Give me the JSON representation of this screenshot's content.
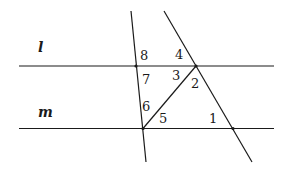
{
  "diagram": {
    "type": "parallel-lines-transversals",
    "stroke_color": "#1a1a1a",
    "lines": [
      {
        "name": "l",
        "label": "l",
        "x1": 19,
        "y1": 66,
        "x2": 274,
        "y2": 66,
        "label_x": 38,
        "label_y": 52
      },
      {
        "name": "m",
        "label": "m",
        "x1": 19,
        "y1": 128.5,
        "x2": 274,
        "y2": 128.5,
        "label_x": 38,
        "label_y": 117
      },
      {
        "name": "left-transversal",
        "x1": 131,
        "y1": 11,
        "x2": 146,
        "y2": 162
      },
      {
        "name": "right-transversal",
        "x1": 164,
        "y1": 11,
        "x2": 252,
        "y2": 162
      },
      {
        "name": "diagonal",
        "x1": 196,
        "y1": 66,
        "x2": 143,
        "y2": 128.5
      }
    ],
    "points": [
      {
        "x": 136,
        "y": 66
      },
      {
        "x": 196,
        "y": 66
      },
      {
        "x": 143,
        "y": 128.5
      },
      {
        "x": 233,
        "y": 128.5
      }
    ],
    "angles": [
      {
        "label": "1",
        "x": 209,
        "y": 123
      },
      {
        "label": "2",
        "x": 191,
        "y": 88
      },
      {
        "label": "3",
        "x": 172,
        "y": 80
      },
      {
        "label": "4",
        "x": 175,
        "y": 59
      },
      {
        "label": "5",
        "x": 159,
        "y": 123
      },
      {
        "label": "6",
        "x": 142,
        "y": 111
      },
      {
        "label": "7",
        "x": 142,
        "y": 84
      },
      {
        "label": "8",
        "x": 140,
        "y": 60
      }
    ]
  }
}
